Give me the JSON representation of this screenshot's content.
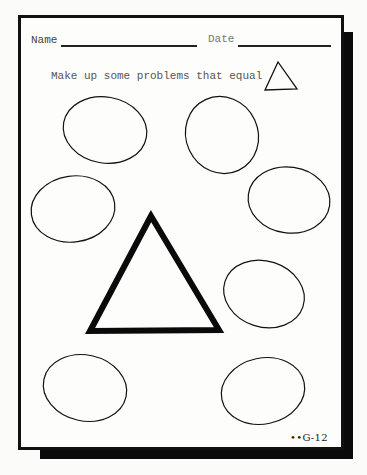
{
  "worksheet": {
    "header": {
      "name_label": "Name",
      "date_label": "Date"
    },
    "instruction": "Make up some problems that equal",
    "instruction_icon": "triangle-icon",
    "answer_shapes": {
      "ovals": [
        {
          "id": 1,
          "cx": 105,
          "cy": 130,
          "rx": 42,
          "ry": 33,
          "rotate": 10
        },
        {
          "id": 2,
          "cx": 222,
          "cy": 135,
          "rx": 37,
          "ry": 38,
          "rotate": -25
        },
        {
          "id": 3,
          "cx": 73,
          "cy": 209,
          "rx": 42,
          "ry": 33,
          "rotate": -8
        },
        {
          "id": 4,
          "cx": 289,
          "cy": 200,
          "rx": 41,
          "ry": 33,
          "rotate": 8
        },
        {
          "id": 5,
          "cx": 264,
          "cy": 294,
          "rx": 41,
          "ry": 33,
          "rotate": 15
        },
        {
          "id": 6,
          "cx": 85,
          "cy": 388,
          "rx": 42,
          "ry": 33,
          "rotate": 12
        },
        {
          "id": 7,
          "cx": 263,
          "cy": 391,
          "rx": 42,
          "ry": 33,
          "rotate": -12
        }
      ],
      "center_shape": "large-triangle"
    },
    "page_code": "••G-12",
    "colors": {
      "ink": "#111111",
      "paper": "#fdfdfc",
      "shadow": "#0a0a0a"
    }
  }
}
